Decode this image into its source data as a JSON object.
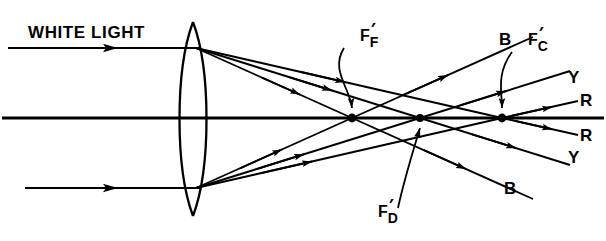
{
  "figure": {
    "title_label": "WHITE LIGHT",
    "background_color": "#ffffff",
    "ink_color": "#000000",
    "width": 606,
    "height": 241
  },
  "optics": {
    "element_name": "biconvex-lens",
    "axis_label": "optical-axis",
    "focal_points": [
      {
        "id": "F-prime-F",
        "base": "F",
        "prime": "′",
        "subscript": "F",
        "x": 352,
        "y": 118
      },
      {
        "id": "F-prime-D",
        "base": "F",
        "prime": "′",
        "subscript": "D",
        "x": 420,
        "y": 118
      },
      {
        "id": "F-prime-C",
        "base": "F",
        "prime": "′",
        "subscript": "C",
        "x": 502,
        "y": 118
      }
    ]
  },
  "labels": {
    "f_f": {
      "base": "F",
      "prime": "′",
      "sub": "F"
    },
    "f_d": {
      "base": "F",
      "prime": "′",
      "sub": "D"
    },
    "f_c": {
      "base": "F",
      "prime": "′",
      "sub": "C"
    },
    "blue_upper": "B",
    "blue_lower": "B",
    "yellow_upper": "Y",
    "yellow_lower": "Y",
    "red_upper": "R",
    "red_lower": "R"
  },
  "rays": {
    "incoming": [
      {
        "name": "incoming-ray-upper",
        "from_x": 8,
        "to_x": 196,
        "y": 48
      },
      {
        "name": "incoming-ray-lower",
        "from_x": 25,
        "to_x": 196,
        "y": 188
      }
    ],
    "emergent_upper_source": {
      "x": 196,
      "y": 48
    },
    "emergent_lower_source": {
      "x": 196,
      "y": 188
    },
    "color_order_upper_exit": [
      "B",
      "Y",
      "R"
    ],
    "color_order_lower_exit": [
      "R",
      "Y",
      "B"
    ]
  }
}
